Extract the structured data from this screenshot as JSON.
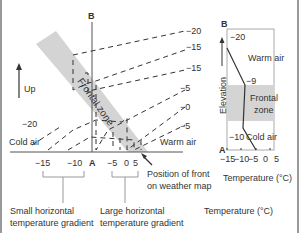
{
  "left_diagram": {
    "top_label": "B",
    "bottom_label": "A",
    "up_label": "Up",
    "frontal_zone_label": "Frontal zone",
    "cold_air_label": "Cold air",
    "warm_air_label": "Warm air",
    "isotherm_right_labels": [
      "−20",
      "−15",
      "−15",
      "−5",
      "−0",
      "−5"
    ],
    "isotherm_left_label": "−20",
    "axis_ticks": [
      "−15",
      "−10",
      "A",
      "−5",
      "0",
      "5"
    ],
    "front_position_label_line1": "Position of front",
    "front_position_label_line2": "on weather map",
    "small_gradient_line1": "Small horizontal",
    "small_gradient_line2": "temperature gradient",
    "large_gradient_line1": "Large horizontal",
    "large_gradient_line2": "temperature gradient",
    "temperature_caption": "Temperature (°C)"
  },
  "right_diagram": {
    "top_label": "B",
    "bottom_label": "A",
    "elevation_label": "Elevation",
    "warm_air_label": "Warm air",
    "frontal_zone_line1": "Frontal",
    "frontal_zone_line2": "zone",
    "cold_air_label": "Cold air",
    "temp_top": "−20",
    "temp_mid_upper": "−9",
    "temp_mid_lower": "−10",
    "x_ticks": [
      "−15",
      "−10",
      "−5",
      "0",
      "5"
    ],
    "x_axis_label": "Temperature (°C)"
  },
  "colors": {
    "frontal_zone": "#d4d4d4",
    "line": "#333333"
  }
}
